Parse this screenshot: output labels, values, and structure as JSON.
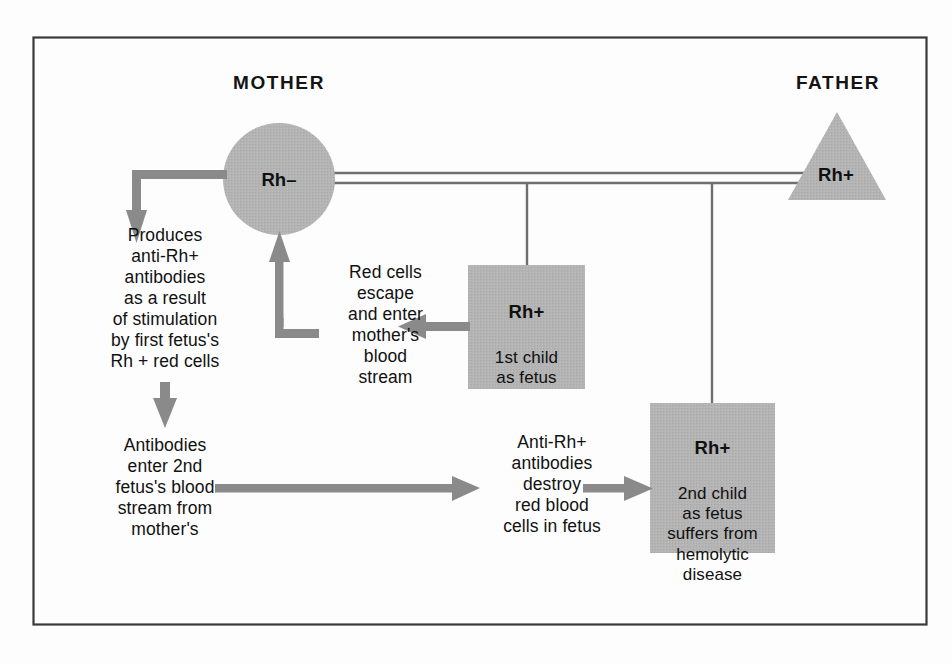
{
  "figure": {
    "title_mother": "MOTHER",
    "title_father": "FATHER",
    "colors": {
      "shape_fill": "#b2b2b2",
      "arrow": "#8a8a8a",
      "line": "#6f6f6f",
      "frame": "#3a3a3a",
      "background": "#fdfdfd",
      "text": "#101010"
    }
  },
  "nodes": {
    "mother": {
      "shape": "circle",
      "label": "Rh–"
    },
    "father": {
      "shape": "triangle",
      "label": "Rh+"
    },
    "first_child": {
      "shape": "square",
      "title": "Rh+",
      "body": "1st child\nas fetus"
    },
    "second_child": {
      "shape": "square",
      "title": "Rh+",
      "body": "2nd child\nas fetus\nsuffers from\nhemolytic\ndisease"
    }
  },
  "annotations": {
    "produces": "Produces\nanti-Rh+\nantibodies\nas a result\nof stimulation\nby first fetus's\nRh + red cells",
    "antibodies_enter": "Antibodies\nenter 2nd\nfetus's blood\nstream from\nmother's",
    "red_cells_escape": "Red cells\nescape\nand enter\nmother's\nblood\nstream",
    "anti_rh_destroy": "Anti-Rh+\nantibodies\ndestroy\nred blood\ncells in fetus"
  },
  "connectors": [
    {
      "name": "marriage-line",
      "type": "double-line",
      "from": "mother",
      "to": "father"
    },
    {
      "name": "descent-line-first-child",
      "type": "line",
      "from": "marriage-line",
      "to": "first_child"
    },
    {
      "name": "descent-line-second-child",
      "type": "line",
      "from": "marriage-line",
      "to": "second_child"
    },
    {
      "name": "mother-to-produces-arrow",
      "type": "elbow-arrow",
      "from": "mother",
      "to": "produces"
    },
    {
      "name": "produces-to-antibodies-arrow",
      "type": "arrow-down",
      "from": "produces",
      "to": "antibodies_enter"
    },
    {
      "name": "first-child-to-red-cells-arrow",
      "type": "arrow-left",
      "from": "first_child",
      "to": "red_cells_escape"
    },
    {
      "name": "red-cells-to-mother-arrow",
      "type": "elbow-arrow-up",
      "from": "red_cells_escape",
      "to": "mother"
    },
    {
      "name": "antibodies-to-anti-rh-arrow",
      "type": "arrow-right",
      "from": "antibodies_enter",
      "to": "anti_rh_destroy"
    },
    {
      "name": "anti-rh-to-second-child-arrow",
      "type": "arrow-right",
      "from": "anti_rh_destroy",
      "to": "second_child"
    }
  ]
}
